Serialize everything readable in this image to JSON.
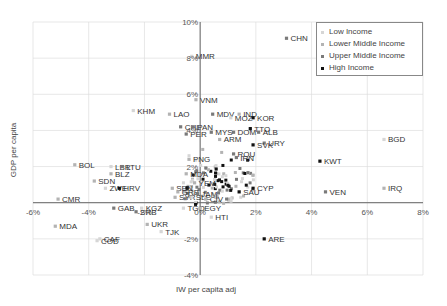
{
  "chart_data": {
    "type": "scatter",
    "title": "",
    "xlabel": "IW per capita adj",
    "ylabel": "GDP per capita",
    "xlim": [
      -0.06,
      0.08
    ],
    "ylim": [
      -0.04,
      0.1
    ],
    "x_ticks": [
      "-6%",
      "-4%",
      "-2%",
      "0%",
      "2%",
      "4%",
      "6%",
      "8%"
    ],
    "y_ticks": [
      "-4%",
      "-2%",
      "",
      "2%",
      "4%",
      "6%",
      "8%",
      "10%"
    ],
    "grid": true,
    "legend_position": "top-right",
    "legend": [
      {
        "name": "Low Income",
        "color": "#d6d6d6"
      },
      {
        "name": "Lower Middle Income",
        "color": "#b3b3b3"
      },
      {
        "name": "Upper Middle Income",
        "color": "#7a7a7a"
      },
      {
        "name": "High Income",
        "color": "#111111"
      }
    ],
    "points": [
      {
        "label": "CHN",
        "x": 0.031,
        "y": 0.091,
        "group": "Upper Middle Income"
      },
      {
        "label": "MMR",
        "x": -0.003,
        "y": 0.081,
        "group": "Low Income"
      },
      {
        "label": "VNM",
        "x": -0.0015,
        "y": 0.057,
        "group": "Lower Middle Income"
      },
      {
        "label": "KHM",
        "x": -0.024,
        "y": 0.051,
        "group": "Low Income"
      },
      {
        "label": "LAO",
        "x": -0.011,
        "y": 0.049,
        "group": "Lower Middle Income"
      },
      {
        "label": "MDV",
        "x": 0.0045,
        "y": 0.049,
        "group": "Upper Middle Income"
      },
      {
        "label": "IND",
        "x": 0.014,
        "y": 0.049,
        "group": "Lower Middle Income"
      },
      {
        "label": "MOZ",
        "x": 0.011,
        "y": 0.047,
        "group": "Low Income"
      },
      {
        "label": "KOR",
        "x": 0.019,
        "y": 0.047,
        "group": "High Income"
      },
      {
        "label": "CHL",
        "x": -0.007,
        "y": 0.042,
        "group": "Upper Middle Income"
      },
      {
        "label": "PAN",
        "x": -0.0025,
        "y": 0.042,
        "group": "Upper Middle Income"
      },
      {
        "label": "TTO",
        "x": 0.018,
        "y": 0.041,
        "group": "High Income"
      },
      {
        "label": "ALB",
        "x": 0.021,
        "y": 0.039,
        "group": "Upper Middle Income"
      },
      {
        "label": "DOM",
        "x": 0.012,
        "y": 0.039,
        "group": "Upper Middle Income"
      },
      {
        "label": "MYS",
        "x": 0.004,
        "y": 0.039,
        "group": "Upper Middle Income"
      },
      {
        "label": "PER",
        "x": -0.005,
        "y": 0.038,
        "group": "Upper Middle Income"
      },
      {
        "label": "ARM",
        "x": 0.007,
        "y": 0.035,
        "group": "Lower Middle Income"
      },
      {
        "label": "URY",
        "x": 0.023,
        "y": 0.033,
        "group": "Upper Middle Income"
      },
      {
        "label": "SVK",
        "x": 0.019,
        "y": 0.032,
        "group": "High Income"
      },
      {
        "label": "KWT",
        "x": 0.043,
        "y": 0.023,
        "group": "High Income"
      },
      {
        "label": "BGD",
        "x": 0.066,
        "y": 0.035,
        "group": "Low Income"
      },
      {
        "label": "ROU",
        "x": 0.012,
        "y": 0.027,
        "group": "Upper Middle Income"
      },
      {
        "label": "IRN",
        "x": 0.013,
        "y": 0.025,
        "group": "Upper Middle Income"
      },
      {
        "label": "PNG",
        "x": -0.004,
        "y": 0.024,
        "group": "Lower Middle Income"
      },
      {
        "label": "BOL",
        "x": -0.045,
        "y": 0.021,
        "group": "Lower Middle Income"
      },
      {
        "label": "LBR",
        "x": -0.032,
        "y": 0.02,
        "group": "Low Income"
      },
      {
        "label": "LTU",
        "x": -0.028,
        "y": 0.02,
        "group": "Upper Middle Income"
      },
      {
        "label": "BLZ",
        "x": -0.032,
        "y": 0.016,
        "group": "Lower Middle Income"
      },
      {
        "label": "MDA",
        "x": -0.005,
        "y": 0.016,
        "group": "Lower Middle Income"
      },
      {
        "label": "SDN",
        "x": -0.038,
        "y": 0.012,
        "group": "Lower Middle Income"
      },
      {
        "label": "YEM",
        "x": -0.002,
        "y": 0.011,
        "group": "Lower Middle Income"
      },
      {
        "label": "ZWE",
        "x": -0.034,
        "y": 0.008,
        "group": "Low Income"
      },
      {
        "label": "HRV",
        "x": -0.029,
        "y": 0.008,
        "group": "High Income"
      },
      {
        "label": "SEN",
        "x": -0.01,
        "y": 0.008,
        "group": "Lower Middle Income"
      },
      {
        "label": "CYP",
        "x": 0.019,
        "y": 0.008,
        "group": "High Income"
      },
      {
        "label": "SAU",
        "x": 0.014,
        "y": 0.006,
        "group": "High Income"
      },
      {
        "label": "VEN",
        "x": 0.045,
        "y": 0.006,
        "group": "Upper Middle Income"
      },
      {
        "label": "IRQ",
        "x": 0.066,
        "y": 0.008,
        "group": "Lower Middle Income"
      },
      {
        "label": "GRB",
        "x": -0.008,
        "y": 0.006,
        "group": "Lower Middle Income"
      },
      {
        "label": "JAM",
        "x": -0.001,
        "y": 0.005,
        "group": "Upper Middle Income"
      },
      {
        "label": "SYR",
        "x": -0.009,
        "y": 0.003,
        "group": "Lower Middle Income"
      },
      {
        "label": "SLE",
        "x": -0.003,
        "y": 0.003,
        "group": "Low Income"
      },
      {
        "label": "CIV",
        "x": 0.002,
        "y": 0.002,
        "group": "Lower Middle Income"
      },
      {
        "label": "CMR",
        "x": -0.051,
        "y": 0.002,
        "group": "Lower Middle Income"
      },
      {
        "label": "GAB",
        "x": -0.031,
        "y": -0.003,
        "group": "Upper Middle Income"
      },
      {
        "label": "KGZ",
        "x": -0.021,
        "y": -0.003,
        "group": "Low Income"
      },
      {
        "label": "SRB",
        "x": -0.023,
        "y": -0.005,
        "group": "Upper Middle Income"
      },
      {
        "label": "TGO",
        "x": -0.006,
        "y": -0.003,
        "group": "Low Income"
      },
      {
        "label": "EGY",
        "x": 0.0,
        "y": -0.003,
        "group": "Lower Middle Income"
      },
      {
        "label": "HTI",
        "x": 0.004,
        "y": -0.008,
        "group": "Low Income"
      },
      {
        "label": "MDA",
        "x": -0.052,
        "y": -0.013,
        "group": "Lower Middle Income"
      },
      {
        "label": "UKR",
        "x": -0.019,
        "y": -0.012,
        "group": "Lower Middle Income"
      },
      {
        "label": "TJK",
        "x": -0.014,
        "y": -0.016,
        "group": "Low Income"
      },
      {
        "label": "CAF",
        "x": -0.036,
        "y": -0.02,
        "group": "Low Income"
      },
      {
        "label": "COD",
        "x": -0.037,
        "y": -0.021,
        "group": "Low Income"
      },
      {
        "label": "ARE",
        "x": 0.023,
        "y": -0.02,
        "group": "High Income"
      }
    ],
    "cluster_note": "Dense cluster of many overlapping unlabeled/illegible points near x 0%..2%, y 0%..3%"
  }
}
